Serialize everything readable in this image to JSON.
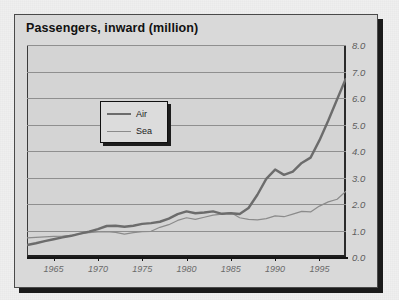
{
  "chart_data": {
    "type": "line",
    "title": "Passengers, inward (million)",
    "xlabel": "",
    "ylabel": "",
    "ylim": [
      0.0,
      8.0
    ],
    "ytick_step": 1.0,
    "yticks": [
      "8.0",
      "7.0",
      "6.0",
      "5.0",
      "4.0",
      "3.0",
      "2.0",
      "1.0",
      "0.0"
    ],
    "xlim": [
      1962,
      1998
    ],
    "xticks": [
      "1965",
      "1970",
      "1975",
      "1980",
      "1985",
      "1990",
      "1995"
    ],
    "grid": "horizontal",
    "legend_position": "upper-left-inside",
    "colors": {
      "air": "#6c6c6c",
      "sea": "#8b8b8b",
      "plot_background": "#d4d4d4",
      "frame_background": "#d9d9d9",
      "gridline": "#8f8f8f"
    },
    "x": [
      1962,
      1963,
      1964,
      1965,
      1966,
      1967,
      1968,
      1969,
      1970,
      1971,
      1972,
      1973,
      1974,
      1975,
      1976,
      1977,
      1978,
      1979,
      1980,
      1981,
      1982,
      1983,
      1984,
      1985,
      1986,
      1987,
      1988,
      1989,
      1990,
      1991,
      1992,
      1993,
      1994,
      1995,
      1996,
      1997,
      1998
    ],
    "series": [
      {
        "name": "Air",
        "values": [
          0.45,
          0.52,
          0.6,
          0.67,
          0.74,
          0.8,
          0.88,
          0.96,
          1.05,
          1.17,
          1.18,
          1.14,
          1.18,
          1.25,
          1.28,
          1.33,
          1.45,
          1.62,
          1.72,
          1.65,
          1.68,
          1.72,
          1.63,
          1.65,
          1.62,
          1.85,
          2.35,
          2.95,
          3.3,
          3.1,
          3.22,
          3.55,
          3.75,
          4.4,
          5.15,
          5.95,
          6.75
        ]
      },
      {
        "name": "Sea",
        "values": [
          0.72,
          0.74,
          0.76,
          0.78,
          0.79,
          0.82,
          0.88,
          0.92,
          0.95,
          0.96,
          0.93,
          0.86,
          0.92,
          0.96,
          0.97,
          1.12,
          1.22,
          1.38,
          1.48,
          1.42,
          1.5,
          1.58,
          1.62,
          1.68,
          1.48,
          1.42,
          1.4,
          1.45,
          1.55,
          1.52,
          1.62,
          1.72,
          1.7,
          1.92,
          2.08,
          2.18,
          2.48
        ]
      }
    ]
  },
  "legend": {
    "items": [
      {
        "label": "Air",
        "series": "Air"
      },
      {
        "label": "Sea",
        "series": "Sea"
      }
    ]
  }
}
